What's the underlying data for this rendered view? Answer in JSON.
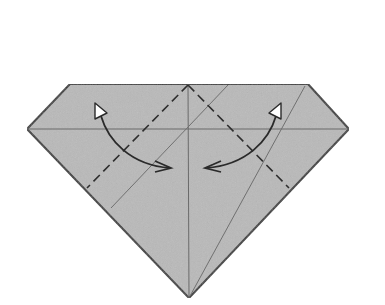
{
  "diagram": {
    "type": "origami-fold-step",
    "colors": {
      "background": "#ffffff",
      "paper": "#b9b9b9",
      "outline": "#3a3a3a",
      "crease": "#6a6a6a",
      "dashed": "#2e2e2e",
      "arrow": "#2a2a2a",
      "arrowhead_fill": "#ffffff"
    },
    "paper_outline": [
      [
        70,
        84
      ],
      [
        308,
        84
      ],
      [
        349,
        129
      ],
      [
        189,
        298
      ],
      [
        27,
        129
      ]
    ],
    "creases": [
      {
        "name": "horizontal-crease",
        "from": [
          27,
          129
        ],
        "to": [
          349,
          129
        ]
      },
      {
        "name": "vertical-center-crease",
        "from": [
          188,
          84
        ],
        "to": [
          189,
          298
        ]
      },
      {
        "name": "left-diagonal-crease",
        "from": [
          228,
          84
        ],
        "to": [
          111,
          208
        ]
      },
      {
        "name": "right-diagonal-crease",
        "from": [
          305,
          86
        ],
        "to": [
          190,
          296
        ]
      }
    ],
    "valley_folds": [
      {
        "name": "left-valley-fold",
        "from": [
          188,
          84
        ],
        "to": [
          87,
          188
        ]
      },
      {
        "name": "right-valley-fold",
        "from": [
          188,
          84
        ],
        "to": [
          289,
          188
        ]
      }
    ],
    "arrows": [
      {
        "name": "left-fold-unfold-arrow",
        "start_head": [
          97,
          106
        ],
        "end_chevron": [
          170,
          168
        ],
        "meaning": "fold and unfold"
      },
      {
        "name": "right-fold-unfold-arrow",
        "start_head": [
          278,
          106
        ],
        "end_chevron": [
          206,
          168
        ],
        "meaning": "fold and unfold"
      }
    ]
  }
}
